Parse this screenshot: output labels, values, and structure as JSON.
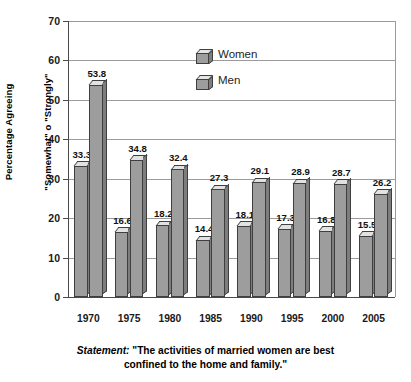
{
  "chart_data": {
    "type": "bar",
    "title": "",
    "subtitle": "",
    "xlabel": "",
    "ylabel_lines": [
      "Percentage Agreeing",
      "\"Somewhat\" o \"Strongly\""
    ],
    "categories": [
      "1970",
      "1975",
      "1980",
      "1985",
      "1990",
      "1995",
      "2000",
      "2005"
    ],
    "series": [
      {
        "name": "Women",
        "values": [
          33.3,
          16.6,
          18.2,
          14.4,
          18.1,
          17.3,
          16.8,
          15.5
        ],
        "labels": [
          "33.3",
          "16.6",
          "18.2",
          "14.4",
          "18.1",
          "17.3",
          "16.8",
          "15.5"
        ]
      },
      {
        "name": "Men",
        "values": [
          53.8,
          34.8,
          32.4,
          27.3,
          29.1,
          28.9,
          28.7,
          26.2
        ],
        "labels": [
          "53.8",
          "34.8",
          "32.4",
          "27.3",
          "29.1",
          "28.9",
          "28.7",
          "26.2"
        ]
      }
    ],
    "ylim": [
      0,
      70
    ],
    "yticks": [
      0,
      10,
      20,
      30,
      40,
      50,
      60,
      70
    ],
    "ytick_labels": [
      "0",
      "10",
      "20",
      "30",
      "40",
      "50",
      "60",
      "70"
    ],
    "grid": true,
    "legend_position": "inside-top-center",
    "annotations": {
      "statement_prefix": "Statement:",
      "statement_line1": " \"The activities of married women are best",
      "statement_line2": "confined to the home and family.\""
    }
  },
  "legend": {
    "items": [
      {
        "label": "Women",
        "icon": "cube-icon"
      },
      {
        "label": "Men",
        "icon": "cube-icon"
      }
    ]
  },
  "colors": {
    "bar_face": "#9d9d9d",
    "bar_top": "#e2e2e2",
    "bar_side": "#7d7d7d",
    "bar_outline": "#3f3f3f",
    "grid": "#9b9b9b",
    "axis": "#4a4a4a",
    "background": "#ffffff",
    "text": "#111111"
  }
}
